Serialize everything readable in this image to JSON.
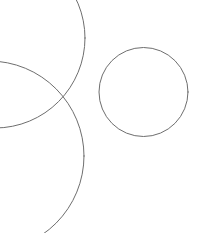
{
  "canvas": {
    "width": 198,
    "height": 233,
    "background_color": "#ffffff",
    "stroke_color": "#6e6e6e",
    "stroke_width": 1,
    "description": "Line drawing of three circle outlines on a white background"
  },
  "chart_data": {
    "type": "scatter",
    "title": "",
    "subtitle": "",
    "xlabel": "",
    "ylabel": "",
    "grid": false,
    "legend_position": "none",
    "xlim": [
      0,
      198
    ],
    "ylim": [
      0,
      233
    ],
    "annotations": [],
    "tick_labels": {
      "x": [],
      "y": []
    },
    "series": [
      {
        "name": "small-circle-right",
        "shape": "circle",
        "cx": 143.5,
        "cy": 92,
        "r": 44.5,
        "clipped": false,
        "stroke": "#6e6e6e"
      },
      {
        "name": "large-circle-upper-left",
        "shape": "circle",
        "cx": -5,
        "cy": 38,
        "r": 90,
        "clipped": true,
        "stroke": "#6e6e6e"
      },
      {
        "name": "large-circle-lower-left",
        "shape": "circle",
        "cx": -11,
        "cy": 156,
        "r": 95,
        "clipped": true,
        "stroke": "#6e6e6e"
      }
    ]
  }
}
